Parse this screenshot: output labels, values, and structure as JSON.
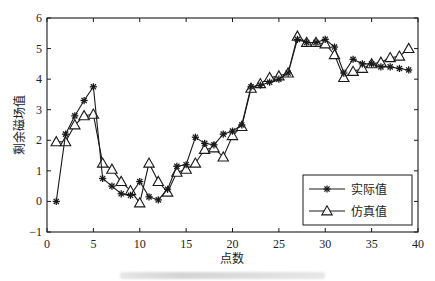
{
  "chart_data": {
    "type": "line",
    "title": "",
    "xlabel": "点数",
    "ylabel": "剩余磁场值",
    "xlim": [
      0,
      40
    ],
    "ylim": [
      -1,
      6
    ],
    "xticks": [
      0,
      5,
      10,
      15,
      20,
      25,
      30,
      35,
      40
    ],
    "yticks": [
      -1,
      0,
      1,
      2,
      3,
      4,
      5,
      6
    ],
    "grid": false,
    "legend_position": "lower right",
    "x": [
      1,
      2,
      3,
      4,
      5,
      6,
      7,
      8,
      9,
      10,
      11,
      12,
      13,
      14,
      15,
      16,
      17,
      18,
      19,
      20,
      21,
      22,
      23,
      24,
      25,
      26,
      27,
      28,
      29,
      30,
      31,
      32,
      33,
      34,
      35,
      36,
      37,
      38,
      39
    ],
    "series": [
      {
        "name": "实际值",
        "marker": "star",
        "values": [
          0,
          2.2,
          2.8,
          3.3,
          3.75,
          0.75,
          0.5,
          0.25,
          0.2,
          0.65,
          0.15,
          0.05,
          0.4,
          1.15,
          1.2,
          2.1,
          1.9,
          1.85,
          2.2,
          2.3,
          2.5,
          3.75,
          3.8,
          3.9,
          4.0,
          4.2,
          5.3,
          5.2,
          5.2,
          5.3,
          5.05,
          4.2,
          4.65,
          4.5,
          4.5,
          4.4,
          4.4,
          4.35,
          4.3
        ]
      },
      {
        "name": "仿真值",
        "marker": "triangle",
        "values": [
          1.95,
          1.95,
          2.5,
          2.8,
          2.85,
          1.25,
          1.05,
          0.65,
          0.35,
          -0.05,
          1.25,
          0.65,
          0.3,
          0.95,
          1.05,
          1.25,
          1.7,
          1.75,
          1.45,
          2.15,
          2.45,
          3.7,
          3.85,
          4.05,
          4.1,
          4.2,
          5.4,
          5.2,
          5.2,
          5.15,
          4.8,
          4.05,
          4.25,
          4.35,
          4.5,
          4.55,
          4.7,
          4.75,
          5.0
        ]
      }
    ]
  },
  "colors": {
    "line": "#1a1a1a",
    "background": "#ffffff"
  }
}
